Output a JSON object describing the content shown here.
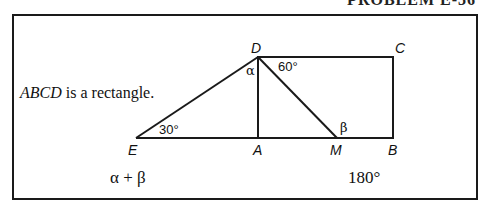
{
  "header": {
    "heading_fragment": "PROBLEM E-36"
  },
  "given": {
    "emphasis": "ABCD",
    "rest": " is a rectangle."
  },
  "figure": {
    "points": {
      "A": {
        "label": "A",
        "x": 258,
        "y": 138
      },
      "B": {
        "label": "B",
        "x": 393,
        "y": 138
      },
      "C": {
        "label": "C",
        "x": 393,
        "y": 57
      },
      "D": {
        "label": "D",
        "x": 258,
        "y": 57
      },
      "E": {
        "label": "E",
        "x": 136,
        "y": 138
      },
      "M": {
        "label": "M",
        "x": 337,
        "y": 138
      }
    },
    "angles": {
      "E": "30°",
      "CDM": "60°",
      "alpha": "α",
      "beta": "β"
    }
  },
  "comparison": {
    "quantity_a": "α + β",
    "quantity_b": "180°"
  },
  "colors": {
    "line": "#1a1a1a",
    "background": "#ffffff"
  }
}
